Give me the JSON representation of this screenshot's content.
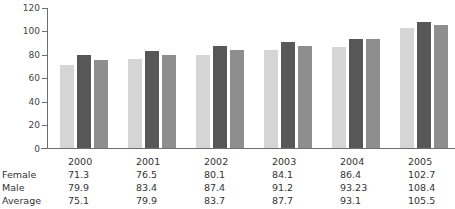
{
  "chart_data": {
    "type": "bar",
    "title": "",
    "xlabel": "",
    "ylabel": "",
    "ylim": [
      0,
      120
    ],
    "yticks": [
      0,
      20,
      40,
      60,
      80,
      100,
      120
    ],
    "grid": false,
    "legend": "none",
    "categories": [
      "2000",
      "2001",
      "2002",
      "2003",
      "2004",
      "2005"
    ],
    "series": [
      {
        "name": "Female",
        "color": "#d5d5d5",
        "values": [
          71.3,
          76.5,
          80.1,
          84.1,
          86.4,
          102.7
        ]
      },
      {
        "name": "Male",
        "color": "#575757",
        "values": [
          79.9,
          83.4,
          87.4,
          91.2,
          93.23,
          108.4
        ]
      },
      {
        "name": "Average",
        "color": "#8e8e8e",
        "values": [
          75.1,
          79.9,
          83.7,
          87.7,
          93.1,
          105.5
        ]
      }
    ]
  },
  "axis": {
    "ytick_labels": [
      "120",
      "100",
      "80",
      "60",
      "40",
      "20",
      "0"
    ]
  },
  "table": {
    "header": {
      "label": "",
      "cells": [
        "2000",
        "2001",
        "2002",
        "2003",
        "2004",
        "2005"
      ]
    },
    "rows": [
      {
        "label": "Female",
        "cells": [
          "71.3",
          "76.5",
          "80.1",
          "84.1",
          "86.4",
          "102.7"
        ]
      },
      {
        "label": "Male",
        "cells": [
          "79.9",
          "83.4",
          "87.4",
          "91.2",
          "93.23",
          "108.4"
        ]
      },
      {
        "label": "Average",
        "cells": [
          "75.1",
          "79.9",
          "83.7",
          "87.7",
          "93.1",
          "105.5"
        ]
      }
    ]
  }
}
